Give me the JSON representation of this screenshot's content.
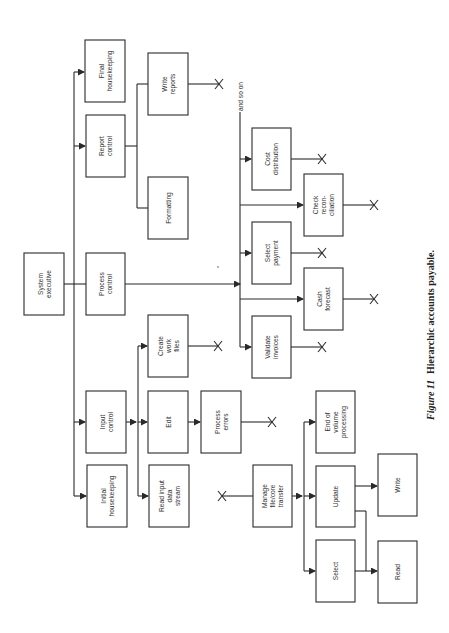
{
  "diagram": {
    "title": "Hierarchic accounts payable",
    "orientation": "rotated-90-ccw",
    "nodes": {
      "system_executive": [
        "System",
        "executive"
      ],
      "final_housekeeping": [
        "Final",
        "housekeeping"
      ],
      "report_control": [
        "Report",
        "control"
      ],
      "write_reports": [
        "Write",
        "reports"
      ],
      "formatting": [
        "Formatting"
      ],
      "process_control": [
        "Process",
        "control"
      ],
      "cost_distribution": [
        "Cost",
        "distribution"
      ],
      "check_reconciliation": [
        "Check",
        "recon-",
        "ciliation"
      ],
      "select_payment": [
        "Select",
        "payment"
      ],
      "cash_forecast": [
        "Cash",
        "forecast"
      ],
      "validate_invoices": [
        "Validate",
        "invoices"
      ],
      "create_work_files": [
        "Create",
        "work",
        "files"
      ],
      "input_control": [
        "Input",
        "control"
      ],
      "edit": [
        "Edit"
      ],
      "process_errors": [
        "Process",
        "errors"
      ],
      "initial_housekeeping": [
        "Initial",
        "housekeeping"
      ],
      "read_input_data_stream": [
        "Read  input",
        "data",
        "stream"
      ],
      "manage_file_core_transfer": [
        "Manage",
        "file/core",
        "transfer"
      ],
      "end_of_volume_processing": [
        "End  of",
        "volume",
        "processing"
      ],
      "update": [
        "Update"
      ],
      "select": [
        "Select"
      ],
      "write": [
        "Write"
      ],
      "read": [
        "Read"
      ]
    },
    "and_so_on": "and  so  on",
    "terminator_symbol": "X"
  },
  "caption": {
    "figure_label": "Figure 11",
    "text": "Hierarchic accounts payable."
  }
}
